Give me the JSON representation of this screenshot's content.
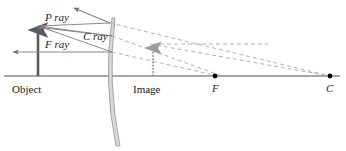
{
  "figure": {
    "type": "optics-ray-diagram",
    "width": 346,
    "height": 151,
    "background_color": "#ffffff"
  },
  "labels": {
    "p_ray": "P ray",
    "c_ray": "C ray",
    "f_ray": "F ray",
    "object": "Object",
    "image": "Image",
    "focal_point": "F",
    "center_of_curvature": "C"
  },
  "colors": {
    "axis": "#8a8a8a",
    "object_arrow": "#5a5a5a",
    "incident_ray": "#8a8a8a",
    "reflected_ray": "#9a9a9a",
    "dashed_ray": "#a0a0a0",
    "mirror": "#b0b0b0",
    "image_dotted": "#9a9a9a",
    "text": "#1a1a1a",
    "point_dot": "#000000"
  },
  "geometry": {
    "axis": {
      "x1": 4,
      "y1": 76,
      "x2": 340,
      "y2": 76
    },
    "object": {
      "x": 38,
      "base_y": 76,
      "tip_y": 26
    },
    "mirror": {
      "top_x": 112,
      "top_y": 18,
      "mid_x": 104,
      "mid_y": 80,
      "bottom_x": 116,
      "bottom_y": 146
    },
    "image": {
      "x": 153,
      "base_y": 76,
      "tip_y": 44
    },
    "focal_point": {
      "x": 215,
      "y": 76
    },
    "center_of_curvature": {
      "x": 330,
      "y": 76
    }
  },
  "rays": [
    {
      "name": "p-ray-incident",
      "description": "Parallel ray from object tip to mirror",
      "style": "solid",
      "x1": 38,
      "y1": 26,
      "x2": 110,
      "y2": 23
    },
    {
      "name": "p-ray-reflected",
      "description": "Reflected P ray diverging up-left",
      "style": "solid-arrow",
      "x1": 110,
      "y1": 23,
      "x2": 71,
      "y2": 7
    },
    {
      "name": "c-ray-incident",
      "description": "Ray from object tip toward center of curvature",
      "style": "solid",
      "x1": 38,
      "y1": 26,
      "x2": 112,
      "y2": 36
    },
    {
      "name": "c-ray-reflected",
      "description": "Reflected C ray back toward left",
      "style": "solid-arrow",
      "x1": 112,
      "y1": 36,
      "x2": 32,
      "y2": 26
    },
    {
      "name": "f-ray-incident",
      "description": "Ray from object tip aimed at focal point",
      "style": "solid",
      "x1": 38,
      "y1": 26,
      "x2": 112,
      "y2": 52
    },
    {
      "name": "f-ray-reflected",
      "description": "Reflected F ray travelling parallel to axis leftward",
      "style": "solid-arrow",
      "x1": 112,
      "y1": 52,
      "x2": 10,
      "y2": 52
    },
    {
      "name": "dashed-extension-p",
      "description": "Dashed virtual extension of P ray toward C",
      "style": "dashed",
      "x1": 110,
      "y1": 23,
      "x2": 330,
      "y2": 76
    },
    {
      "name": "dashed-extension-c",
      "description": "Dashed virtual extension of C ray through F region",
      "style": "dashed",
      "x1": 112,
      "y1": 36,
      "x2": 218,
      "y2": 74
    },
    {
      "name": "dashed-extension-f",
      "description": "Dashed horizontal extension from image tip to the right",
      "style": "dashed",
      "x1": 153,
      "y1": 44,
      "x2": 268,
      "y2": 44
    },
    {
      "name": "dashed-extension-f2",
      "description": "Dashed ray from mirror through F toward right",
      "style": "dashed",
      "x1": 112,
      "y1": 52,
      "x2": 214,
      "y2": 75
    },
    {
      "name": "dashed-converge-image",
      "description": "Dashed line converging at the image tip from the right",
      "style": "dashed",
      "x1": 153,
      "y1": 44,
      "x2": 330,
      "y2": 76
    }
  ]
}
